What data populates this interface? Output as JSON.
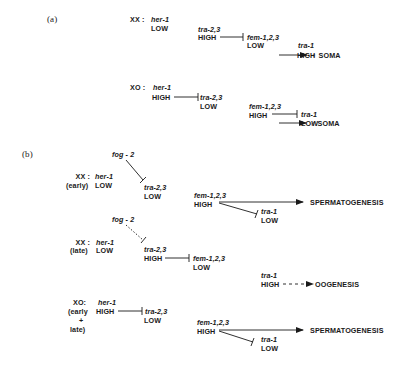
{
  "panel_a": {
    "label": "(a)",
    "xx": {
      "genotype": "XX :",
      "her1": {
        "gene": "her-1",
        "level": "LOW"
      },
      "tra23": {
        "gene": "tra-2,3",
        "level": "HIGH"
      },
      "fem123": {
        "gene": "fem-1,2,3",
        "level": "LOW"
      },
      "tra1": {
        "gene": "tra-1",
        "level": "HIGH"
      },
      "outcome": "♀ SOMA"
    },
    "xo": {
      "genotype": "XO :",
      "her1": {
        "gene": "her-1",
        "level": "HIGH"
      },
      "tra23": {
        "gene": "tra-2,3",
        "level": "LOW"
      },
      "fem123": {
        "gene": "fem-1,2,3",
        "level": "HIGH"
      },
      "tra1": {
        "gene": "tra-1",
        "level": "LOW"
      },
      "outcome": "♂ SOMA"
    }
  },
  "panel_b": {
    "label": "(b)",
    "xx_early": {
      "genotype": "XX :",
      "stage": "(early)",
      "fog2": "fog - 2",
      "her1": {
        "gene": "her-1",
        "level": "LOW"
      },
      "tra23": {
        "gene": "tra-2,3",
        "level": "LOW"
      },
      "fem123": {
        "gene": "fem-1,2,3",
        "level": "HIGH"
      },
      "tra1": {
        "gene": "tra-1",
        "level": "LOW"
      },
      "outcome": "SPERMATOGENESIS"
    },
    "xx_late": {
      "genotype": "XX :",
      "stage": "(late)",
      "fog2": "fog - 2",
      "her1": {
        "gene": "her-1",
        "level": "LOW"
      },
      "tra23": {
        "gene": "tra-2,3",
        "level": "HIGH"
      },
      "fem123": {
        "gene": "fem-1,2,3",
        "level": "LOW"
      },
      "tra1": {
        "gene": "tra-1",
        "level": "HIGH"
      },
      "outcome": "OOGENESIS"
    },
    "xo": {
      "genotype": "XO:",
      "stage_lines": [
        "(early",
        "+",
        "late)"
      ],
      "her1": {
        "gene": "her-1",
        "level": "HIGH"
      },
      "tra23": {
        "gene": "tra-2,3",
        "level": "LOW"
      },
      "fem123": {
        "gene": "fem-1,2,3",
        "level": "HIGH"
      },
      "tra1": {
        "gene": "tra-1",
        "level": "LOW"
      },
      "outcome": "SPERMATOGENESIS"
    }
  },
  "colors": {
    "ink": "#1a1a1a",
    "background": "#ffffff"
  }
}
